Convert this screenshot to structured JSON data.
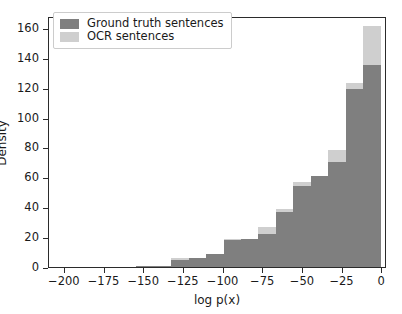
{
  "chart_data": {
    "type": "bar",
    "title": "",
    "xlabel": "log p(x)",
    "ylabel": "Density",
    "xlim": [
      -210,
      3
    ],
    "ylim": [
      0,
      168
    ],
    "grid": false,
    "legend_position": "upper left",
    "xticks": [
      -200,
      -175,
      -150,
      -125,
      -100,
      -75,
      -50,
      -25,
      0
    ],
    "xticklabels": [
      "−200",
      "−175",
      "−150",
      "−125",
      "−100",
      "−75",
      "−50",
      "−25",
      "0"
    ],
    "yticks": [
      0,
      20,
      40,
      60,
      80,
      100,
      120,
      140,
      160
    ],
    "yticklabels": [
      "0",
      "20",
      "40",
      "60",
      "80",
      "100",
      "120",
      "140",
      "160"
    ],
    "bin_edges": [
      -210,
      -199,
      -188,
      -177,
      -166,
      -155,
      -144,
      -133,
      -122,
      -111,
      -100,
      -89,
      -78,
      -67,
      -56,
      -45,
      -34,
      -23,
      -12,
      -1
    ],
    "series": [
      {
        "name": "Ground truth sentences",
        "color": "#7f7f7f",
        "values": [
          0,
          0,
          0,
          0,
          0,
          1,
          1,
          5,
          6,
          9,
          18,
          19,
          22,
          37,
          54,
          61,
          70,
          119,
          135,
          15
        ]
      },
      {
        "name": "OCR sentences",
        "color": "#cfcfcf",
        "values": [
          0,
          0,
          0,
          0,
          0,
          1,
          1,
          6,
          6,
          9,
          19,
          19,
          27,
          39,
          57,
          61,
          78,
          123,
          161,
          34
        ]
      }
    ]
  },
  "legend": {
    "items": [
      {
        "label": "Ground truth sentences",
        "color": "#7f7f7f"
      },
      {
        "label": "OCR sentences",
        "color": "#cfcfcf"
      }
    ]
  }
}
